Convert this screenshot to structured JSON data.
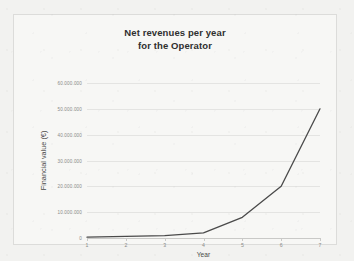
{
  "chart_data": {
    "type": "line",
    "title": "Net revenues per year for the Operator",
    "title_lines": [
      "Net revenues per year",
      "for the Operator"
    ],
    "xlabel": "Year",
    "ylabel": "Financial value (€)",
    "x": [
      1,
      2,
      3,
      4,
      5,
      6,
      7
    ],
    "categories": [
      "1",
      "2",
      "3",
      "4",
      "5",
      "6",
      "7"
    ],
    "values": [
      300000,
      600000,
      900000,
      2000000,
      8000000,
      20000000,
      50000000
    ],
    "series": [
      {
        "name": "Net revenues",
        "values": [
          300000,
          600000,
          900000,
          2000000,
          8000000,
          20000000,
          50000000
        ]
      }
    ],
    "xlim": [
      1,
      7
    ],
    "ylim": [
      0,
      60000000
    ],
    "ytick_values": [
      0,
      10000000,
      20000000,
      30000000,
      40000000,
      50000000,
      60000000
    ],
    "ytick_labels": [
      "0",
      "10.000.000",
      "20.000.000",
      "30.000.000",
      "40.000.000",
      "50.000.000",
      "60.000.000"
    ],
    "xtick_labels": [
      "1",
      "2",
      "3",
      "4",
      "5",
      "6",
      "7"
    ],
    "grid": true,
    "grid_axis": "y",
    "legend": false,
    "legend_position": "none",
    "line_color": "#4a4a4a",
    "grid_color": "#e4e4e2",
    "plot_background": "#f7f7f5",
    "border_color": "#dcdcda"
  }
}
